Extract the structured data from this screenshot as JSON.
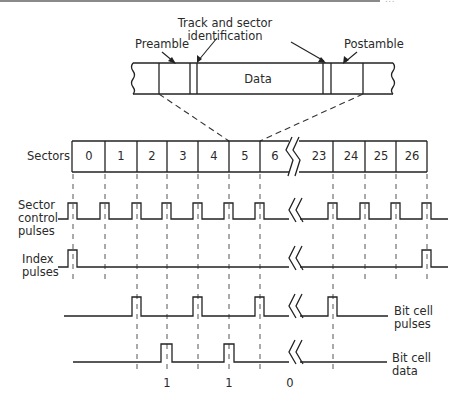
{
  "header": {
    "rule_visible": true,
    "cropped_text": "..."
  },
  "track_detail": {
    "title_line1": "Track and sector",
    "title_line2": "identification",
    "preamble_label": "Preamble",
    "postamble_label": "Postamble",
    "data_label": "Data"
  },
  "sectors": {
    "row_label": "Sectors",
    "cells": [
      "0",
      "1",
      "2",
      "3",
      "4",
      "5",
      "6",
      "23",
      "24",
      "25",
      "26"
    ]
  },
  "signals": {
    "sector_control": {
      "label_lines": [
        "Sector",
        "control",
        "pulses"
      ]
    },
    "index": {
      "label_lines": [
        "Index",
        "pulses"
      ]
    },
    "bit_cell_pulses": {
      "label_lines": [
        "Bit cell",
        "pulses"
      ]
    },
    "bit_cell_data": {
      "label_lines": [
        "Bit cell",
        "data"
      ],
      "bit_values": [
        "1",
        "1",
        "0"
      ]
    }
  },
  "colors": {
    "line": "#222222",
    "dashed": "#555555",
    "text": "#2a2a2a",
    "background": "#ffffff"
  }
}
